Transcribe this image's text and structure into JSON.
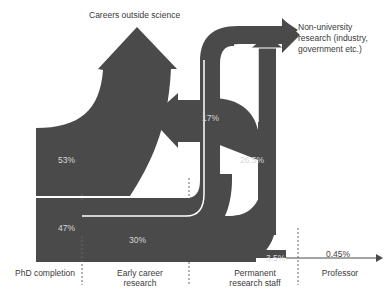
{
  "colors": {
    "flow": "#4a4a4a",
    "background": "#ffffff",
    "separator": "#ffffff",
    "divider": "#555555",
    "label_text": "#3a3a3a",
    "flow_text": "#d8d8d8"
  },
  "destinations": {
    "outside": "Careers outside science",
    "nonuni_line1": "Non-university",
    "nonuni_line2": "research (industry,",
    "nonuni_line3": "government etc.)"
  },
  "stages": [
    {
      "id": "phd",
      "label_line1": "PhD completion",
      "label_line2": ""
    },
    {
      "id": "early",
      "label_line1": "Early career",
      "label_line2": "research"
    },
    {
      "id": "permanent",
      "label_line1": "Permanent",
      "label_line2": "research staff"
    },
    {
      "id": "professor",
      "label_line1": "Professor",
      "label_line2": ""
    }
  ],
  "flows": [
    {
      "id": "outside",
      "from": "PhD completion",
      "to": "Careers outside science",
      "label": "53%"
    },
    {
      "id": "stay",
      "from": "PhD completion",
      "to": "Early career research",
      "label": "47%"
    },
    {
      "id": "early",
      "from": "Early career research",
      "to": "Permanent research staff",
      "label": "30%"
    },
    {
      "id": "nonuni",
      "from": "Early career research",
      "to": "Non-university research",
      "label": "17%"
    },
    {
      "id": "perm",
      "from": "Permanent research staff",
      "to": "Non-university / outside science",
      "label": "26.5%"
    },
    {
      "id": "staff",
      "from": "Permanent research staff",
      "to": "Professor",
      "label": "3.5%"
    },
    {
      "id": "prof",
      "from": "Permanent research staff",
      "to": "Professor",
      "label": "0.45%"
    }
  ]
}
